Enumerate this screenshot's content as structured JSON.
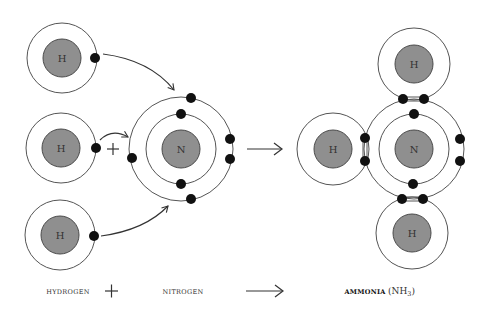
{
  "diagram": {
    "reactants": {
      "hydrogen_atoms": [
        {
          "symbol": "H"
        },
        {
          "symbol": "H"
        },
        {
          "symbol": "H"
        }
      ],
      "nitrogen_atom": {
        "symbol": "N"
      }
    },
    "product": {
      "nitrogen_atom": {
        "symbol": "N"
      },
      "hydrogen_atoms": [
        {
          "symbol": "H"
        },
        {
          "symbol": "H"
        },
        {
          "symbol": "H"
        }
      ]
    },
    "operators": {
      "plus": "+",
      "arrow": "→"
    },
    "labels": {
      "hydrogen": "HYDROGEN",
      "plus": "+",
      "nitrogen": "NITROGEN",
      "ammonia": "AMMONIA",
      "formula": "(NH",
      "formula_sub": "3",
      "formula_close": ")"
    },
    "colors": {
      "nucleus": "#8f8f8f",
      "electron": "#111111",
      "orbit": "#555555"
    }
  }
}
